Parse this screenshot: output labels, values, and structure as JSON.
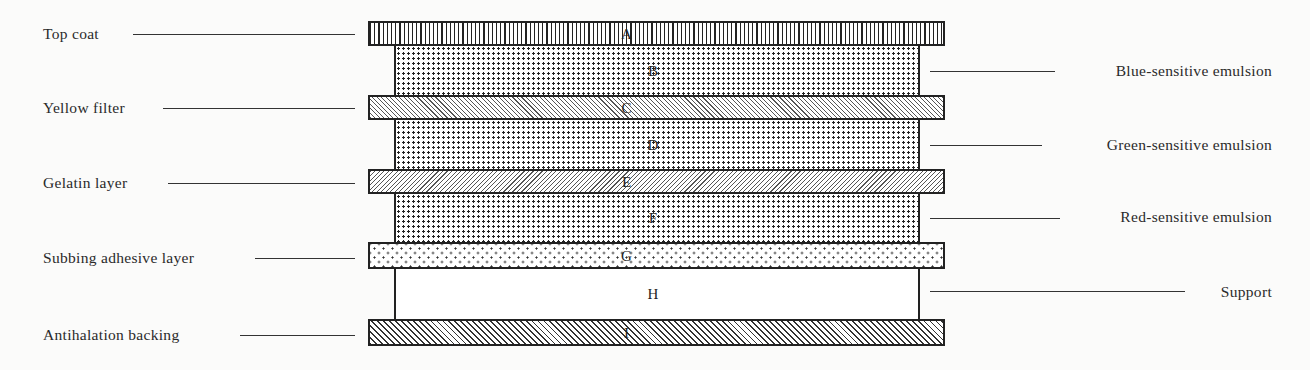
{
  "diagram": {
    "type": "layer-stack",
    "layers": [
      {
        "letter": "A",
        "name": "Top coat",
        "side": "left",
        "pattern": "vertical-lines"
      },
      {
        "letter": "B",
        "name": "Blue-sensitive emulsion",
        "side": "right",
        "pattern": "dense-dots"
      },
      {
        "letter": "C",
        "name": "Yellow filter",
        "side": "left",
        "pattern": "fine-diagonal-hatch"
      },
      {
        "letter": "D",
        "name": "Green-sensitive emulsion",
        "side": "right",
        "pattern": "dense-dots"
      },
      {
        "letter": "E",
        "name": "Gelatin layer",
        "side": "left",
        "pattern": "fine-diagonal-hatch"
      },
      {
        "letter": "F",
        "name": "Red-sensitive emulsion",
        "side": "right",
        "pattern": "dense-dots"
      },
      {
        "letter": "G",
        "name": "Subbing adhesive layer",
        "side": "left",
        "pattern": "sparse-dots"
      },
      {
        "letter": "H",
        "name": "Support",
        "side": "right",
        "pattern": "plain"
      },
      {
        "letter": "I",
        "name": "Antihalation backing",
        "side": "left",
        "pattern": "diagonal-hatch"
      }
    ]
  }
}
